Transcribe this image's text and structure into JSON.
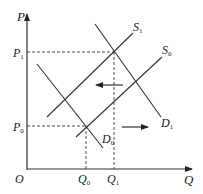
{
  "diagram": {
    "type": "supply-demand",
    "axes": {
      "x_label": "Q",
      "y_label": "P",
      "origin_label": "O"
    },
    "price_labels": {
      "p1": {
        "base": "P",
        "sub": "1"
      },
      "p0": {
        "base": "P",
        "sub": "0"
      }
    },
    "quantity_labels": {
      "q0": {
        "base": "Q",
        "sub": "0"
      },
      "q1": {
        "base": "Q",
        "sub": "1"
      }
    },
    "curves": {
      "s1": {
        "base": "S",
        "sub": "1"
      },
      "s0": {
        "base": "S",
        "sub": "0"
      },
      "d1": {
        "base": "D",
        "sub": "1"
      },
      "d0": {
        "base": "D",
        "sub": "0"
      }
    },
    "annotations": {
      "left_arrow": "supply shift left (S0 to S1)",
      "right_arrow": "demand shift right (D0 to D1)"
    },
    "colors": {
      "line": "#333333",
      "text": "#1a1a1a"
    }
  }
}
